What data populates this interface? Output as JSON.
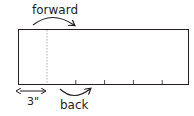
{
  "labels": {
    "forward": "forward",
    "back": "back",
    "measure": "3\""
  },
  "colors": {
    "stroke": "#231f20",
    "dashed": "#9a9a9a"
  },
  "ticks_count": 4
}
